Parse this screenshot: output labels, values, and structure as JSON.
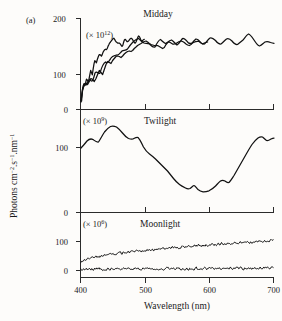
{
  "figure": {
    "panel_letter": "(a)",
    "y_axis_title": "Photons cm",
    "y_axis_title_full": "Photons cm⁻².s⁻¹.nm⁻¹",
    "y_axis_parts": {
      "p1": "Photons cm",
      "sup1": "−2",
      "p2": ".s",
      "sup2": "−1",
      "p3": ".nm",
      "sup3": "−1"
    },
    "x_axis_title": "Wavelength (nm)",
    "background_color": "#fdfcfa",
    "line_color": "#111111",
    "axis_color": "#2b2b2b"
  },
  "chart_data": {
    "type": "line",
    "title": "",
    "xlabel": "Wavelength (nm)",
    "ylabel": "Photons cm⁻².s⁻¹.nm⁻¹",
    "xlim": [
      390,
      705
    ],
    "xticks": [
      400,
      500,
      600,
      700
    ],
    "xticklabels": [
      "400",
      "500",
      "600",
      "700"
    ],
    "grid": false,
    "legend": "none",
    "panels": [
      {
        "name": "midday-panel",
        "label": "Midday",
        "scale_prefix": "(× 10",
        "scale_exponent": "12",
        "scale_suffix": ")",
        "scale_text": "(× 10¹²)",
        "yticks": [
          100,
          200
        ],
        "yticklabels": [
          "100",
          "200"
        ],
        "ylim": [
          60,
          215
        ],
        "series": [
          {
            "name": "Midday irradiance",
            "x": [
              398,
              402,
              406,
              410,
              414,
              418,
              422,
              426,
              430,
              434,
              438,
              442,
              446,
              450,
              454,
              458,
              462,
              466,
              470,
              474,
              478,
              482,
              486,
              490,
              494,
              498,
              502,
              506,
              510,
              514,
              518,
              522,
              526,
              530,
              534,
              538,
              542,
              546,
              550,
              554,
              558,
              562,
              566,
              570,
              574,
              578,
              582,
              586,
              590,
              594,
              598,
              602,
              606,
              610,
              614,
              618,
              622,
              626,
              630,
              634,
              638,
              642,
              646,
              650,
              654,
              658,
              662,
              666,
              670,
              674,
              678,
              682,
              686,
              690,
              694,
              698,
              701
            ],
            "y": [
              78,
              98,
              106,
              110,
              107,
              112,
              118,
              116,
              112,
              118,
              126,
              134,
              130,
              126,
              136,
              146,
              152,
              150,
              148,
              154,
              158,
              162,
              163,
              162,
              160,
              163,
              167,
              170,
              172,
              173,
              172,
              174,
              178,
              181,
              184,
              186,
              188,
              190,
              192,
              193,
              191,
              188,
              186,
              185,
              184,
              184,
              184,
              182,
              180,
              178,
              180,
              186,
              190,
              191,
              189,
              187,
              187,
              188,
              190,
              192,
              193,
              192,
              190,
              187,
              185,
              184,
              186,
              190,
              194,
              197,
              196,
              193,
              189,
              186,
              184,
              186,
              187
            ]
          }
        ]
      },
      {
        "name": "twilight-panel",
        "label": "Twilight",
        "scale_prefix": "(× 10",
        "scale_exponent": "9",
        "scale_suffix": ")",
        "scale_text": "(× 10⁹)",
        "yticks": [
          0,
          100
        ],
        "yticklabels": [
          "0",
          "100"
        ],
        "ylim": [
          0,
          260
        ],
        "y_inverted": true,
        "series": [
          {
            "name": "Twilight irradiance",
            "x": [
              398,
              404,
              410,
              416,
              422,
              428,
              434,
              440,
              446,
              452,
              458,
              464,
              470,
              476,
              482,
              488,
              494,
              500,
              506,
              512,
              518,
              524,
              530,
              536,
              542,
              548,
              554,
              560,
              566,
              572,
              578,
              584,
              590,
              596,
              602,
              608,
              614,
              620,
              626,
              632,
              638,
              644,
              650,
              656,
              662,
              668,
              674,
              680,
              686,
              692,
              698,
              701
            ],
            "y": [
              103,
              96,
              86,
              82,
              84,
              80,
              68,
              58,
              50,
              44,
              42,
              43,
              48,
              56,
              64,
              70,
              69,
              78,
              96,
              108,
              120,
              130,
              140,
              150,
              160,
              172,
              184,
              196,
              206,
              214,
              210,
              216,
              222,
              222,
              218,
              212,
              204,
              196,
              182,
              176,
              168,
              150,
              132,
              116,
              100,
              84,
              72,
              62,
              58,
              66,
              60,
              56
            ]
          }
        ]
      },
      {
        "name": "moonlight-panel",
        "label": "Moonlight",
        "scale_prefix": "(× 10",
        "scale_exponent": "6",
        "scale_suffix": ")",
        "scale_text": "(× 10⁶)",
        "yticks": [
          0,
          100,
          0
        ],
        "yticklabels": [
          "0",
          "100",
          "0"
        ],
        "ylim": [
          -8,
          135
        ],
        "series": [
          {
            "name": "Moonlight upper trace",
            "noisy": true,
            "x_range": [
              398,
              700
            ],
            "baseline_start": 28,
            "baseline_end": 103,
            "noise_amplitude": 6
          },
          {
            "name": "Moonlight lower trace",
            "noisy": true,
            "x_range": [
              398,
              700
            ],
            "baseline_start": 4,
            "baseline_end": 8,
            "noise_amplitude": 6
          }
        ]
      }
    ]
  }
}
